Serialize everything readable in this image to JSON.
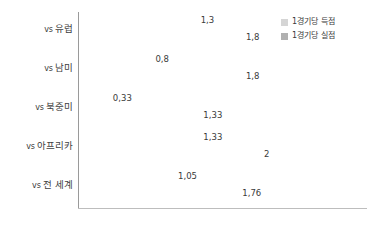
{
  "chart_data": {
    "type": "bar",
    "orientation": "horizontal",
    "title": "",
    "subtitle": "",
    "xlabel": "",
    "ylabel": "",
    "xlim": [
      0,
      2.2
    ],
    "grid": false,
    "legend_position": "top-right",
    "categories": [
      "vs 유럽",
      "vs 남미",
      "vs 북중미",
      "vs 아프리카",
      "vs 전 세계"
    ],
    "series": [
      {
        "name": "1경기당 득점",
        "color": "#d5d5d5",
        "values": [
          1.3,
          0.8,
          0.33,
          1.33,
          1.05
        ],
        "labels": [
          "1,3",
          "0,8",
          "0,33",
          "1,33",
          "1,05"
        ]
      },
      {
        "name": "1경기당 실점",
        "color": "#b0b0b0",
        "values": [
          1.8,
          1.8,
          1.33,
          2,
          1.76
        ],
        "labels": [
          "1,8",
          "1,8",
          "1,33",
          "2",
          "1,76"
        ]
      }
    ],
    "tick_labels_x": [],
    "tick_labels_y": [
      "vs 유럽",
      "vs 남미",
      "vs 북중미",
      "vs 아프리카",
      "vs 전 세계"
    ]
  },
  "legend": {
    "items": [
      {
        "label": "1경기당 득점",
        "color": "#d5d5d5"
      },
      {
        "label": "1경기당 실점",
        "color": "#b0b0b0"
      }
    ]
  },
  "axes": {
    "y_axis_color": "#9a9a9a",
    "x_axis_color": "#bdbdbd"
  },
  "background_color": "#ffffff"
}
